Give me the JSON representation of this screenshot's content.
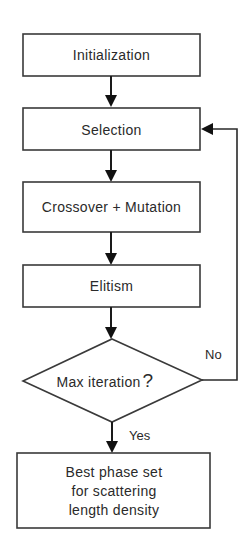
{
  "diagram": {
    "type": "flowchart",
    "nodes": [
      {
        "id": "init",
        "shape": "rectangle",
        "label": "Initialization"
      },
      {
        "id": "selection",
        "shape": "rectangle",
        "label": "Selection"
      },
      {
        "id": "crossover",
        "shape": "rectangle",
        "label": "Crossover + Mutation"
      },
      {
        "id": "elitism",
        "shape": "rectangle",
        "label": "Elitism"
      },
      {
        "id": "decision",
        "shape": "diamond",
        "label": "Max iteration",
        "label_suffix": "?"
      },
      {
        "id": "result",
        "shape": "rectangle",
        "label_lines": [
          "Best phase set",
          "for scattering",
          "length density"
        ]
      }
    ],
    "edges": [
      {
        "from": "init",
        "to": "selection",
        "label": ""
      },
      {
        "from": "selection",
        "to": "crossover",
        "label": ""
      },
      {
        "from": "crossover",
        "to": "elitism",
        "label": ""
      },
      {
        "from": "elitism",
        "to": "decision",
        "label": ""
      },
      {
        "from": "decision",
        "to": "selection",
        "label": "No"
      },
      {
        "from": "decision",
        "to": "result",
        "label": "Yes"
      }
    ]
  }
}
